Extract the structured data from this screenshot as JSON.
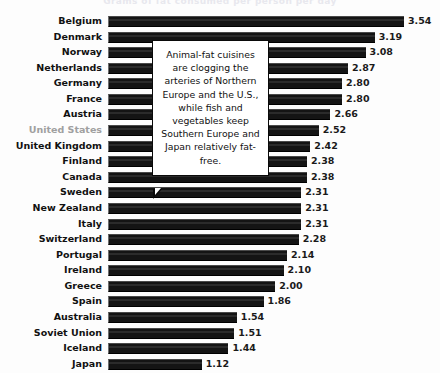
{
  "title_clipped": "Grams of fat consumed per person per day",
  "callout": {
    "text": "Animal-fat cuisines are clogging the arteries of Northern Europe and the U.S., while fish and vegetables keep Southern Europe and Japan relatively fat-free."
  },
  "highlight": {
    "category": "United States",
    "color": "#a0a0a0"
  },
  "colors": {
    "bar": "#141414",
    "background": "#fdfdfd",
    "label": "#111111",
    "muted_label": "#a0a0a0",
    "callout_border": "#0a0a0a",
    "callout_fill": "#ffffff"
  },
  "chart_data": {
    "type": "bar",
    "orientation": "horizontal",
    "title": "",
    "xlabel": "",
    "ylabel": "",
    "xlim": [
      0,
      3.54
    ],
    "grid": false,
    "legend": false,
    "value_labels": true,
    "categories": [
      "Belgium",
      "Denmark",
      "Norway",
      "Netherlands",
      "Germany",
      "France",
      "Austria",
      "United States",
      "United Kingdom",
      "Finland",
      "Canada",
      "Sweden",
      "New Zealand",
      "Italy",
      "Switzerland",
      "Portugal",
      "Ireland",
      "Greece",
      "Spain",
      "Australia",
      "Soviet Union",
      "Iceland",
      "Japan"
    ],
    "values": [
      3.54,
      3.19,
      3.08,
      2.87,
      2.8,
      2.8,
      2.66,
      2.52,
      2.42,
      2.38,
      2.38,
      2.31,
      2.31,
      2.31,
      2.28,
      2.14,
      2.1,
      2.0,
      1.86,
      1.54,
      1.51,
      1.44,
      1.12
    ],
    "value_labels_text": [
      "3.54",
      "3.19",
      "3.08",
      "2.87",
      "2.80",
      "2.80",
      "2.66",
      "2.52",
      "2.42",
      "2.38",
      "2.38",
      "2.31",
      "2.31",
      "2.31",
      "2.28",
      "2.14",
      "2.10",
      "2.00",
      "1.86",
      "1.54",
      "1.51",
      "1.44",
      "1.12"
    ]
  }
}
